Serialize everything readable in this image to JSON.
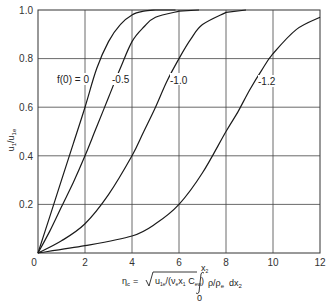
{
  "chart_data": {
    "type": "line",
    "title": "",
    "xlabel": "η_c = √(u_1e/(ν_e x_1 C_ew)) ∫_0^x2 ρ/ρ_e dx_2",
    "ylabel": "u_1/u_1e",
    "xlim": [
      0,
      12
    ],
    "ylim": [
      0,
      1.0
    ],
    "grid": true,
    "legend": "none (inline curve labels)",
    "x_ticks": [
      "0",
      "2",
      "4",
      "6",
      "8",
      "10",
      "12"
    ],
    "y_ticks": [
      "0",
      "0.2",
      "0.4",
      "0.6",
      "0.8",
      "1.0"
    ],
    "series": [
      {
        "name": "f(0) = 0",
        "label": "f(0) = 0",
        "x": [
          0,
          0.5,
          1.0,
          1.5,
          2.0,
          2.5,
          3.0,
          3.5,
          4.0,
          4.5,
          5.0
        ],
        "y": [
          0,
          0.15,
          0.3,
          0.45,
          0.6,
          0.76,
          0.87,
          0.94,
          0.98,
          0.995,
          1.0
        ]
      },
      {
        "name": "-0.5",
        "label": "-0.5",
        "x": [
          0,
          0.5,
          1.0,
          1.5,
          2.0,
          2.5,
          3.0,
          3.5,
          4.0,
          4.5,
          5.0,
          6.0
        ],
        "y": [
          0,
          0.09,
          0.19,
          0.29,
          0.4,
          0.52,
          0.64,
          0.76,
          0.87,
          0.93,
          0.97,
          0.995
        ]
      },
      {
        "name": "-1.0",
        "label": "-1.0",
        "x": [
          0,
          1.0,
          2.0,
          3.0,
          4.0,
          4.5,
          5.0,
          5.5,
          6.0,
          6.5,
          7.0,
          8.0
        ],
        "y": [
          0,
          0.05,
          0.12,
          0.24,
          0.4,
          0.5,
          0.6,
          0.71,
          0.8,
          0.88,
          0.94,
          0.99
        ]
      },
      {
        "name": "-1.2",
        "label": "-1.2",
        "x": [
          0,
          2.0,
          4.0,
          5.0,
          6.0,
          7.0,
          8.0,
          8.5,
          9.0,
          9.5,
          10.0,
          11.0,
          12.0
        ],
        "y": [
          0,
          0.03,
          0.07,
          0.12,
          0.2,
          0.33,
          0.5,
          0.58,
          0.67,
          0.75,
          0.82,
          0.92,
          0.97
        ]
      }
    ]
  },
  "axes": {
    "ylabel_main": "u",
    "ylabel_sub1": "1",
    "ylabel_sep": "/u",
    "ylabel_sub2": "1e",
    "xlabel_eta": "η",
    "xlabel_eta_sub": "c",
    "xlabel_eq": "=",
    "xlabel_sqrt_content": "u",
    "xlabel_sqrt_sub1": "1e",
    "xlabel_sqrt_mid": "/(ν",
    "xlabel_sqrt_sub2": "e",
    "xlabel_sqrt_mid2": "x",
    "xlabel_sqrt_sub3": "1",
    "xlabel_sqrt_mid3": " C",
    "xlabel_sqrt_sub4": "ew",
    "xlabel_sqrt_close": ")",
    "xlabel_int_upper": "x",
    "xlabel_int_upper_sub": "2",
    "xlabel_int_lower": "0",
    "xlabel_integrand": "ρ/ρ",
    "xlabel_integrand_sub": "e",
    "xlabel_dx": "dx",
    "xlabel_dx_sub": "2"
  },
  "labels": {
    "curve0": "f(0) = 0",
    "curve1": "-0.5",
    "curve2": "-1.0",
    "curve3": "-1.2"
  },
  "ticks": {
    "x": [
      "0",
      "2",
      "4",
      "6",
      "8",
      "10",
      "12"
    ],
    "y": [
      "0",
      "0.2",
      "0.4",
      "0.6",
      "0.8",
      "1.0"
    ]
  },
  "colors": {
    "line": "#1a1a1a",
    "grid": "#333333",
    "background": "#ffffff"
  }
}
